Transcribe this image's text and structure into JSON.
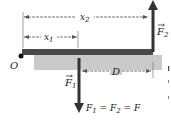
{
  "diagram": {
    "pivot_label": "O",
    "dimensions": {
      "x1": {
        "base": "x",
        "sub": "1"
      },
      "x2": {
        "base": "x",
        "sub": "2"
      },
      "D": {
        "base": "D"
      }
    },
    "forces": {
      "F1": {
        "base": "F",
        "sub": "1",
        "direction": "down"
      },
      "F2": {
        "base": "F",
        "sub": "2",
        "direction": "up"
      }
    },
    "equation": {
      "parts": [
        "F",
        "1",
        " = ",
        "F",
        "2",
        " = ",
        "F"
      ]
    },
    "colors": {
      "bar_top": "#4a4a4a",
      "bar_shadow": "#c8c8c8",
      "arrow": "#333333",
      "dimension_line": "#555555",
      "text": "#222222"
    }
  }
}
